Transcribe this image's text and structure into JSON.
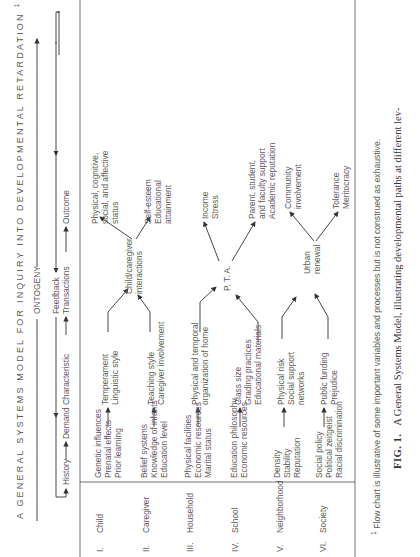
{
  "title": "A GENERAL SYSTEMS MODEL FOR INQUIRY INTO DEVELOPMENTAL RETARDATION",
  "title_footnote_marker": "1",
  "timeline": {
    "ontogeny": "ONTOGENY",
    "feedback": "Feedback",
    "stages": [
      "History",
      "Demand Characteristic",
      "Transactions",
      "Outcome"
    ]
  },
  "levels": [
    {
      "numeral": "I.",
      "name": "Child",
      "history": [
        "Genetic influences",
        "Prenatal effects",
        "Prior learning"
      ],
      "demand": [
        "Temperament",
        "Linguistic style"
      ]
    },
    {
      "numeral": "II.",
      "name": "Caregiver",
      "history": [
        "Belief systems",
        "Knowledge of infants",
        "Education level"
      ],
      "demand": [
        "Teaching style",
        "Caregiver involvement"
      ]
    },
    {
      "numeral": "III.",
      "name": "Household",
      "history": [
        "Physical facilities",
        "Economic resources",
        "Marital status"
      ],
      "demand": [
        "Physical and temporal",
        "organization of home"
      ]
    },
    {
      "numeral": "IV.",
      "name": "School",
      "history": [
        "Education philosophy",
        "Economic resources"
      ],
      "demand": [
        "Class size",
        "Grading practices",
        "Educational materials"
      ]
    },
    {
      "numeral": "V.",
      "name": "Neighborhood",
      "history": [
        "Density",
        "Stability",
        "Reputation"
      ],
      "demand": [
        "Physical risk",
        "Social support",
        "networks"
      ]
    },
    {
      "numeral": "VI.",
      "name": "Society",
      "history": [
        "Social policy",
        "Political zeitgeist",
        "Racial discrimination"
      ],
      "demand": [
        "Public funding",
        "Prejudice"
      ]
    }
  ],
  "transactions": [
    {
      "label": [
        "Child/caregiver",
        "interactions"
      ],
      "outcomes": [
        [
          "Physical, cognitive,",
          "social, and affective",
          "status"
        ],
        [
          "Self-esteem",
          "Educational",
          "attainment"
        ]
      ]
    },
    {
      "label": [
        "P. T. A."
      ],
      "outcomes": [
        [
          "Income",
          "Stress"
        ],
        [
          "Parent, student,",
          "and faculty support",
          "Academic reputation"
        ]
      ]
    },
    {
      "label": [
        "Urban",
        "renewal"
      ],
      "outcomes": [
        [
          "Community",
          "involvement"
        ],
        [
          "Tolerance",
          "Meritocracy"
        ]
      ]
    }
  ],
  "footnote": {
    "marker": "1",
    "text": "Flow chart is illustrative of some important variables and processes but is not construed as exhaustive."
  },
  "caption": {
    "label": "FIG. 1.",
    "text": "A General Systems Model, illustrating developmental paths at different lev-"
  }
}
